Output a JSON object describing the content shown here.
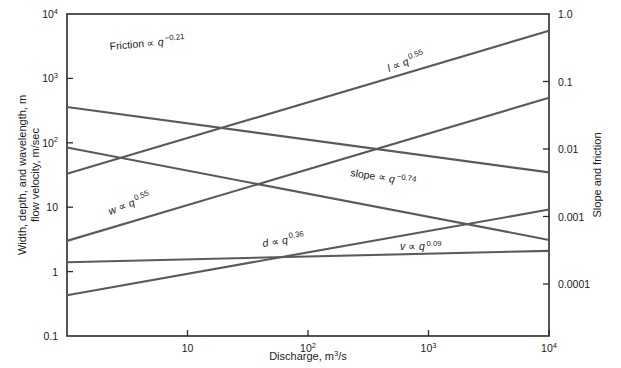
{
  "chart_data": {
    "type": "line",
    "title": "",
    "subtitle": "",
    "xlabel": "Discharge, m3/s",
    "xlabel_parts": {
      "text": "Discharge,  m",
      "sup": "3",
      "tail": "/s"
    },
    "ylabel_left_line1": "Width, depth, and wavelength, m",
    "ylabel_left_line2": "flow velocity, m/sec",
    "ylabel_right": "Slope and friction",
    "xscale": "log",
    "yscale": "log",
    "xlim": [
      1,
      10000
    ],
    "ylim_left": [
      0.1,
      10000
    ],
    "ylim_right": [
      1e-05,
      1.0
    ],
    "grid": false,
    "legend": "inline-annotations",
    "xticks": [
      {
        "value": 10,
        "label": "10",
        "mantissa": "10",
        "exp": ""
      },
      {
        "value": 100,
        "label": "10^2",
        "mantissa": "10",
        "exp": "2"
      },
      {
        "value": 1000,
        "label": "10^3",
        "mantissa": "10",
        "exp": "3"
      },
      {
        "value": 10000,
        "label": "10^4",
        "mantissa": "10",
        "exp": "4"
      }
    ],
    "yticks_left": [
      {
        "value": 10000,
        "mantissa": "10",
        "exp": "4"
      },
      {
        "value": 1000,
        "mantissa": "10",
        "exp": "3"
      },
      {
        "value": 100,
        "mantissa": "10",
        "exp": "2"
      },
      {
        "value": 10,
        "mantissa": "10",
        "exp": ""
      },
      {
        "value": 1,
        "mantissa": "1",
        "exp": ""
      },
      {
        "value": 0.1,
        "mantissa": "0.1",
        "exp": ""
      }
    ],
    "yticks_right": [
      {
        "value": 1.0,
        "label": "1.0"
      },
      {
        "value": 0.1,
        "label": "0.1"
      },
      {
        "value": 0.01,
        "label": "0.01"
      },
      {
        "value": 0.001,
        "label": "0.001"
      },
      {
        "value": 0.0001,
        "label": "0.0001"
      }
    ],
    "series": [
      {
        "key": "friction",
        "name": "Friction",
        "variable": "Friction",
        "exponent": "−0.21",
        "label_text": "Friction ∝ q",
        "label_exp": "−0.21",
        "axis": "right",
        "x": [
          1,
          10000
        ],
        "y": [
          0.042,
          0.0045
        ],
        "color": "#5a5a5a"
      },
      {
        "key": "slope",
        "name": "slope",
        "variable": "slope",
        "exponent": "−0.74",
        "label_text": "slope ∝ q",
        "label_exp": "−0.74",
        "axis": "right",
        "x": [
          1,
          10000
        ],
        "y": [
          0.0105,
          0.00045
        ],
        "color": "#5a5a5a"
      },
      {
        "key": "wavelength",
        "name": "l",
        "variable": "l",
        "exponent": "0.55",
        "label_text": "l ∝ q",
        "label_exp": "0.55",
        "axis": "left",
        "x": [
          1,
          10000
        ],
        "y": [
          33,
          5500
        ],
        "color": "#5a5a5a"
      },
      {
        "key": "width",
        "name": "w",
        "variable": "w",
        "exponent": "0.55",
        "label_text": "w ∝ q",
        "label_exp": "0.55",
        "axis": "left",
        "x": [
          1,
          10000
        ],
        "y": [
          3.0,
          500
        ],
        "color": "#5a5a5a"
      },
      {
        "key": "depth",
        "name": "d",
        "variable": "d",
        "exponent": "0.36",
        "label_text": "d ∝ q",
        "label_exp": "0.36",
        "axis": "left",
        "x": [
          1,
          10000
        ],
        "y": [
          0.43,
          9.2
        ],
        "color": "#5a5a5a"
      },
      {
        "key": "velocity",
        "name": "v",
        "variable": "v",
        "exponent": "0.09",
        "label_text": "v ∝ q",
        "label_exp": "0.09",
        "axis": "left",
        "x": [
          1,
          10000
        ],
        "y": [
          1.4,
          2.1
        ],
        "color": "#5a5a5a"
      }
    ],
    "annotations": [
      {
        "key": "friction",
        "text": "Friction ∝ q",
        "exp": "−0.21",
        "x": 110,
        "y": 50,
        "rotate": -5
      },
      {
        "key": "wavelength",
        "text": "l ∝ q",
        "exp": "0.55",
        "x": 389,
        "y": 72,
        "rotate": -21
      },
      {
        "key": "slope",
        "text": "slope ∝ q",
        "exp": "−0.74",
        "x": 350,
        "y": 176,
        "rotate": 9
      },
      {
        "key": "width",
        "text": "w ∝ q",
        "exp": "0.55",
        "x": 110,
        "y": 215,
        "rotate": -21
      },
      {
        "key": "depth",
        "text": "d ∝ q",
        "exp": "0.36",
        "x": 263,
        "y": 247,
        "rotate": -9
      },
      {
        "key": "velocity",
        "text": "v ∝ q",
        "exp": "0.09",
        "x": 400,
        "y": 250,
        "rotate": 0
      }
    ],
    "colors": {
      "line": "#5a5a5a",
      "axis": "#2b2b2b",
      "text": "#1a1a1a",
      "background": "#ffffff"
    }
  }
}
